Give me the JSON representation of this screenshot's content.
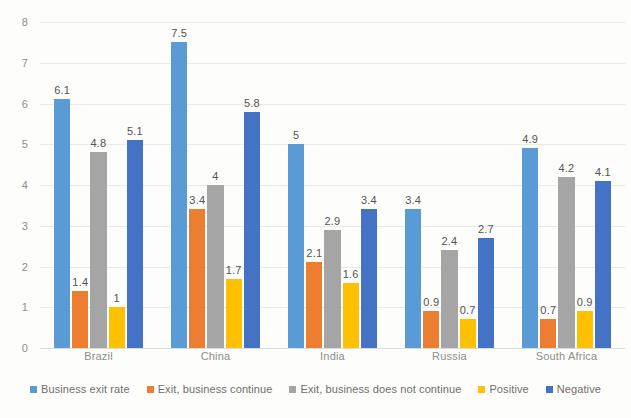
{
  "chart_data": {
    "type": "bar",
    "title": "",
    "xlabel": "",
    "ylabel": "",
    "ylim": [
      0,
      8
    ],
    "ytick_step": 1,
    "yticks": [
      "8",
      "7",
      "6",
      "5",
      "4",
      "3",
      "2",
      "1",
      "0"
    ],
    "grid": true,
    "legend_position": "bottom",
    "categories": [
      "Brazil",
      "China",
      "India",
      "Russia",
      "South Africa"
    ],
    "series": [
      {
        "name": "Business exit rate",
        "color": "#5B9BD5",
        "values": [
          6.1,
          7.5,
          5,
          3.4,
          4.9
        ],
        "labels": [
          "6.1",
          "7.5",
          "5",
          "3.4",
          "4.9"
        ]
      },
      {
        "name": "Exit, business continue",
        "color": "#ED7D31",
        "values": [
          1.4,
          3.4,
          2.1,
          0.9,
          0.7
        ],
        "labels": [
          "1.4",
          "3.4",
          "2.1",
          "0.9",
          "0.7"
        ]
      },
      {
        "name": "Exit, business does not continue",
        "color": "#A5A5A5",
        "values": [
          4.8,
          4,
          2.9,
          2.4,
          4.2
        ],
        "labels": [
          "4.8",
          "4",
          "2.9",
          "2.4",
          "4.2"
        ]
      },
      {
        "name": "Positive",
        "color": "#FFC000",
        "values": [
          1,
          1.7,
          1.6,
          0.7,
          0.9
        ],
        "labels": [
          "1",
          "1.7",
          "1.6",
          "0.7",
          "0.9"
        ]
      },
      {
        "name": "Negative",
        "color": "#4472C4",
        "values": [
          5.1,
          5.8,
          3.4,
          2.7,
          4.1
        ],
        "labels": [
          "5.1",
          "5.8",
          "3.4",
          "2.7",
          "4.1"
        ]
      }
    ]
  }
}
